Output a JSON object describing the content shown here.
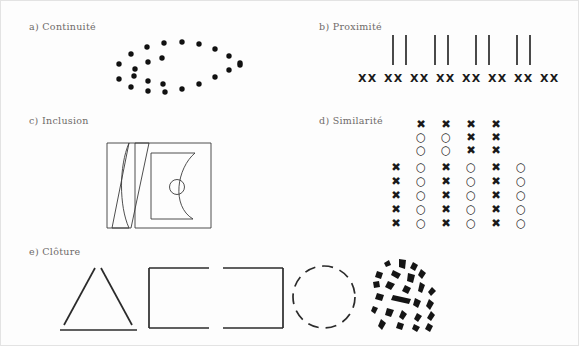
{
  "figure": {
    "language": "fr",
    "background_color": "#fdfdfd",
    "ink_color": "#1a1a1a",
    "label_color": "#6e6a68",
    "panels": [
      {
        "id": "a",
        "label": "a)  Continuité",
        "principle": "Continuité"
      },
      {
        "id": "b",
        "label": "b)  Proximité",
        "principle": "Proximité"
      },
      {
        "id": "c",
        "label": "c)  Inclusion",
        "principle": "Inclusion"
      },
      {
        "id": "d",
        "label": "d)  Similarité",
        "principle": "Similarité"
      },
      {
        "id": "e",
        "label": "e)  Clôture",
        "principle": "Clôture"
      }
    ]
  },
  "panel_a": {
    "label": "a)  Continuité",
    "description": "two crossing dotted arcs forming a lens / ellipse",
    "dot_count": 24,
    "dot_radius": 2.6,
    "arc_upper": [
      [
        118,
        63
      ],
      [
        130,
        53
      ],
      [
        146,
        46
      ],
      [
        163,
        42
      ],
      [
        181,
        41
      ],
      [
        198,
        43
      ],
      [
        214,
        48
      ],
      [
        228,
        55
      ],
      [
        238,
        64
      ]
    ],
    "arc_lower": [
      [
        118,
        78
      ],
      [
        130,
        85
      ],
      [
        146,
        89
      ],
      [
        163,
        90
      ],
      [
        181,
        87
      ],
      [
        198,
        82
      ],
      [
        214,
        75
      ],
      [
        228,
        68
      ],
      [
        238,
        62
      ]
    ],
    "arc_inner_upper": [
      [
        134,
        68
      ],
      [
        146,
        61
      ],
      [
        160,
        57
      ]
    ],
    "arc_inner_lower": [
      [
        132,
        75
      ],
      [
        146,
        80
      ],
      [
        161,
        83
      ]
    ]
  },
  "panel_b": {
    "label": "b)  Proximité",
    "description": "4 grouped pairs of vertical bars above an evenly spaced row of XX pairs",
    "line_pairs": 4,
    "line_pair_x": [
      392,
      434,
      475,
      516
    ],
    "line_pair_gap": 13,
    "line_top": 34,
    "line_height": 30,
    "line_width": 1.6,
    "x_row_label": "XX",
    "x_pair_count": 8,
    "x_pair_x": [
      357,
      383,
      409,
      435,
      461,
      487,
      513,
      539
    ],
    "x_row_y": 76,
    "x_glyph": "×"
  },
  "panel_c": {
    "label": "c)  Inclusion",
    "description": "a left lens slab, a bowtie, and a large square enclosing a D-shape with a small circle",
    "outer_square": {
      "x": 134,
      "y": 142,
      "w": 76,
      "h": 85
    },
    "left_slab": {
      "x": 108,
      "y": 142,
      "w": 26,
      "h": 85
    },
    "bowtie": {
      "x": 126,
      "y": 142,
      "w": 22,
      "h": 85
    },
    "inner_d": {
      "x": 150,
      "y": 152,
      "w": 44,
      "h": 66
    },
    "small_circle": {
      "cx": 176,
      "cy": 186,
      "r": 7
    }
  },
  "panel_d": {
    "label": "d)  Similarité",
    "description": "two glyph blocks: a 3x4 block (columns grouped by shape) and a 5x6 block (columns alternate X and O)",
    "glyph_x": "✖",
    "glyph_o": "○",
    "top_block": {
      "rows": 3,
      "cols": 4,
      "origin_x": 414,
      "origin_y": 118,
      "step_x": 25,
      "step_y": 13,
      "cells": [
        [
          "X",
          "X",
          "X",
          "X"
        ],
        [
          "O",
          "O",
          "X",
          "X"
        ],
        [
          "O",
          "O",
          "X",
          "X"
        ]
      ]
    },
    "bottom_block": {
      "rows": 5,
      "cols": 6,
      "origin_x": 389,
      "origin_y": 160,
      "step_x": 25,
      "step_y": 14,
      "cells": [
        [
          "X",
          "O",
          "X",
          "O",
          "X",
          "O"
        ],
        [
          "X",
          "O",
          "X",
          "O",
          "X",
          "O"
        ],
        [
          "X",
          "O",
          "X",
          "O",
          "X",
          "O"
        ],
        [
          "X",
          "O",
          "X",
          "O",
          "X",
          "O"
        ],
        [
          "X",
          "O",
          "X",
          "O",
          "X",
          "O"
        ]
      ]
    }
  },
  "panel_e": {
    "label": "e)  Clôture",
    "description": "five incomplete contours: gapped triangle, square open right, square open left, dashed circle, fragmented blob shape",
    "shapes": [
      {
        "name": "gapped-triangle",
        "x": 58,
        "y": 265,
        "w": 80,
        "h": 62
      },
      {
        "name": "square-open-right",
        "x": 148,
        "y": 266,
        "w": 62,
        "h": 60
      },
      {
        "name": "square-open-left",
        "x": 222,
        "y": 266,
        "w": 62,
        "h": 60
      },
      {
        "name": "dashed-circle",
        "x": 290,
        "y": 263,
        "w": 66,
        "h": 66
      },
      {
        "name": "fragmented-blobs",
        "x": 372,
        "y": 258,
        "w": 72,
        "h": 80
      }
    ],
    "dashed_circle": {
      "cx": 323,
      "cy": 296,
      "r": 31,
      "dash": "10 7"
    }
  }
}
